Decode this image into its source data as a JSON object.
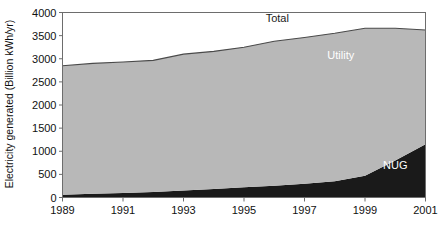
{
  "chart_data": {
    "type": "area",
    "title": "",
    "xlabel": "",
    "ylabel": "Electricity generated  (Billion kWh/yr)",
    "xlim": [
      1989,
      2001
    ],
    "ylim": [
      0,
      4000
    ],
    "grid": false,
    "legend_position": "inline-annotations",
    "x": [
      1989,
      1990,
      1991,
      1992,
      1993,
      1994,
      1995,
      1996,
      1997,
      1998,
      1999,
      2000,
      2001
    ],
    "xticks": [
      1989,
      1991,
      1993,
      1995,
      1997,
      1999,
      2001
    ],
    "xtick_labels": [
      "1989",
      "1991",
      "1993",
      "1995",
      "1997",
      "1999",
      "2001"
    ],
    "yticks": [
      0,
      500,
      1000,
      1500,
      2000,
      2500,
      3000,
      3500,
      4000
    ],
    "ytick_labels": [
      "0",
      "500",
      "1000",
      "1500",
      "2000",
      "2500",
      "3000",
      "3500",
      "4000"
    ],
    "stacked": true,
    "series": [
      {
        "name": "NUG",
        "color": "#1a1a1a",
        "values": [
          60,
          80,
          100,
          120,
          150,
          185,
          220,
          255,
          300,
          350,
          470,
          800,
          1150
        ]
      },
      {
        "name": "Utility",
        "color": "#b8b8b8",
        "values": [
          2790,
          2820,
          2830,
          2845,
          2950,
          2975,
          3030,
          3125,
          3160,
          3200,
          3190,
          2860,
          2470
        ]
      }
    ],
    "total": {
      "name": "Total",
      "color": "#4a4a4a",
      "values": [
        2850,
        2900,
        2930,
        2965,
        3100,
        3160,
        3250,
        3380,
        3460,
        3550,
        3660,
        3660,
        3620
      ]
    },
    "annotations": [
      {
        "text": "Total",
        "x": 1996.1,
        "y": 3800,
        "style": "dark"
      },
      {
        "text": "Utility",
        "x": 1998.2,
        "y": 3000,
        "style": "light"
      },
      {
        "text": "NUG",
        "x": 2000.0,
        "y": 620,
        "style": "light"
      }
    ]
  }
}
